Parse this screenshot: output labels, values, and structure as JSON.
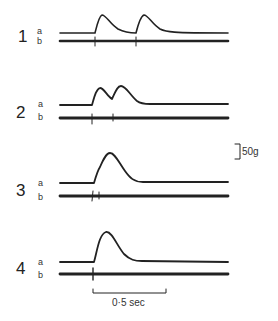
{
  "figure": {
    "panels": [
      {
        "number": "1",
        "label_a": "a",
        "label_b": "b"
      },
      {
        "number": "2",
        "label_a": "a",
        "label_b": "b"
      },
      {
        "number": "3",
        "label_a": "a",
        "label_b": "b"
      },
      {
        "number": "4",
        "label_a": "a",
        "label_b": "b"
      }
    ],
    "force_scale": "50g",
    "time_scale": "0·5 sec"
  }
}
